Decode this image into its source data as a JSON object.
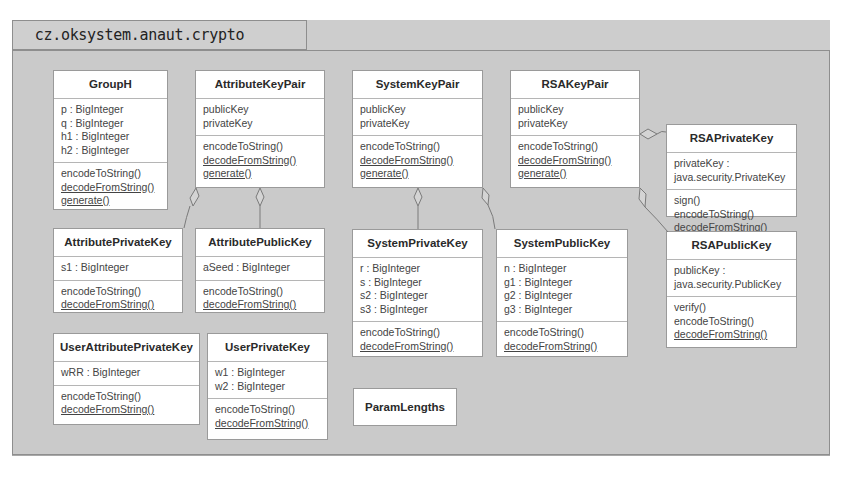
{
  "package": {
    "name": "cz.oksystem.anaut.crypto"
  },
  "classes": {
    "groupH": {
      "name": "GroupH",
      "attributes": [
        "p : BigInteger",
        "q : BigInteger",
        "h1 : BigInteger",
        "h2 : BigInteger"
      ],
      "methods": [
        {
          "label": "encodeToString()",
          "static": false
        },
        {
          "label": "decodeFromString()",
          "static": true
        },
        {
          "label": "generate()",
          "static": true
        }
      ]
    },
    "attributeKeyPair": {
      "name": "AttributeKeyPair",
      "attributes": [
        "publicKey",
        "privateKey"
      ],
      "methods": [
        {
          "label": "encodeToString()",
          "static": false
        },
        {
          "label": "decodeFromString()",
          "static": true
        },
        {
          "label": "generate()",
          "static": true
        }
      ]
    },
    "systemKeyPair": {
      "name": "SystemKeyPair",
      "attributes": [
        "publicKey",
        "privateKey"
      ],
      "methods": [
        {
          "label": "encodeToString()",
          "static": false
        },
        {
          "label": "decodeFromString()",
          "static": true
        },
        {
          "label": "generate()",
          "static": true
        }
      ]
    },
    "rsaKeyPair": {
      "name": "RSAKeyPair",
      "attributes": [
        "publicKey",
        "privateKey"
      ],
      "methods": [
        {
          "label": "encodeToString()",
          "static": false
        },
        {
          "label": "decodeFromString()",
          "static": true
        },
        {
          "label": "generate()",
          "static": true
        }
      ]
    },
    "rsaPrivateKey": {
      "name": "RSAPrivateKey",
      "attributes": [
        "privateKey :",
        "java.security.PrivateKey"
      ],
      "methods": [
        {
          "label": "sign()",
          "static": false
        },
        {
          "label": "encodeToString()",
          "static": false
        },
        {
          "label": "decodeFromString()",
          "static": true
        }
      ]
    },
    "attributePrivateKey": {
      "name": "AttributePrivateKey",
      "attributes": [
        "s1 : BigInteger"
      ],
      "methods": [
        {
          "label": "encodeToString()",
          "static": false
        },
        {
          "label": "decodeFromString()",
          "static": true
        }
      ]
    },
    "attributePublicKey": {
      "name": "AttributePublicKey",
      "attributes": [
        "aSeed : BigInteger"
      ],
      "methods": [
        {
          "label": "encodeToString()",
          "static": false
        },
        {
          "label": "decodeFromString()",
          "static": true
        }
      ]
    },
    "systemPrivateKey": {
      "name": "SystemPrivateKey",
      "attributes": [
        "r : BigInteger",
        "s : BigInteger",
        "s2 : BigInteger",
        "s3 : BigInteger"
      ],
      "methods": [
        {
          "label": "encodeToString()",
          "static": false
        },
        {
          "label": "decodeFromString()",
          "static": true
        }
      ]
    },
    "systemPublicKey": {
      "name": "SystemPublicKey",
      "attributes": [
        "n : BigInteger",
        "g1 : BigInteger",
        "g2 : BigInteger",
        "g3 : BigInteger"
      ],
      "methods": [
        {
          "label": "encodeToString()",
          "static": false
        },
        {
          "label": "decodeFromString()",
          "static": true
        }
      ]
    },
    "rsaPublicKey": {
      "name": "RSAPublicKey",
      "attributes": [
        "publicKey :",
        "java.security.PublicKey"
      ],
      "methods": [
        {
          "label": "verify()",
          "static": false
        },
        {
          "label": "encodeToString()",
          "static": false
        },
        {
          "label": "decodeFromString()",
          "static": true
        }
      ]
    },
    "userAttributePrivateKey": {
      "name": "UserAttributePrivateKey",
      "attributes": [
        "wRR : BigInteger"
      ],
      "methods": [
        {
          "label": "encodeToString()",
          "static": false
        },
        {
          "label": "decodeFromString()",
          "static": true
        }
      ]
    },
    "userPrivateKey": {
      "name": "UserPrivateKey",
      "attributes": [
        "w1 : BigInteger",
        "w2 : BigInteger"
      ],
      "methods": [
        {
          "label": "encodeToString()",
          "static": false
        },
        {
          "label": "decodeFromString()",
          "static": true
        }
      ]
    },
    "paramLengths": {
      "name": "ParamLengths"
    }
  },
  "relations": [
    {
      "type": "aggregation",
      "whole": "AttributeKeyPair",
      "part": "AttributePrivateKey"
    },
    {
      "type": "aggregation",
      "whole": "AttributeKeyPair",
      "part": "AttributePublicKey"
    },
    {
      "type": "aggregation",
      "whole": "SystemKeyPair",
      "part": "SystemPrivateKey"
    },
    {
      "type": "aggregation",
      "whole": "SystemKeyPair",
      "part": "SystemPublicKey"
    },
    {
      "type": "aggregation",
      "whole": "RSAKeyPair",
      "part": "RSAPrivateKey"
    },
    {
      "type": "aggregation",
      "whole": "RSAKeyPair",
      "part": "RSAPublicKey"
    }
  ]
}
